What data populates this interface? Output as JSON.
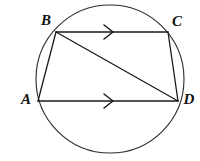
{
  "figure": {
    "background_color": "#ffffff",
    "stroke_color": "#1a1a1a",
    "circle_stroke_color": "#2b2b2b",
    "label_color": "#111111",
    "width": 200,
    "height": 161
  },
  "circle": {
    "name": "circumscribed-circle",
    "cx": 110,
    "cy": 79,
    "r": 74
  },
  "vertices": [
    {
      "id": "A",
      "label": "A",
      "x": 38,
      "y": 101,
      "label_x": 26,
      "label_y": 101
    },
    {
      "id": "B",
      "label": "B",
      "x": 56,
      "y": 32,
      "label_x": 46,
      "label_y": 22
    },
    {
      "id": "C",
      "label": "C",
      "x": 168,
      "y": 32,
      "label_x": 177,
      "label_y": 23
    },
    {
      "id": "D",
      "label": "D",
      "x": 178,
      "y": 101,
      "label_x": 189,
      "label_y": 101
    }
  ],
  "segments": [
    {
      "id": "AB",
      "from": "A",
      "to": "B",
      "kind": "chord",
      "x1": 38,
      "y1": 101,
      "x2": 56,
      "y2": 32
    },
    {
      "id": "BC",
      "from": "B",
      "to": "C",
      "kind": "chord",
      "x1": 56,
      "y1": 32,
      "x2": 168,
      "y2": 32
    },
    {
      "id": "CD",
      "from": "C",
      "to": "D",
      "kind": "chord",
      "x1": 168,
      "y1": 32,
      "x2": 178,
      "y2": 101
    },
    {
      "id": "AD",
      "from": "A",
      "to": "D",
      "kind": "chord",
      "x1": 38,
      "y1": 101,
      "x2": 178,
      "y2": 101
    },
    {
      "id": "BD",
      "from": "B",
      "to": "D",
      "kind": "diagonal",
      "x1": 56,
      "y1": 32,
      "x2": 178,
      "y2": 101
    }
  ],
  "parallel_marks": [
    {
      "id": "mark-BC",
      "on_segment": "BC",
      "glyph": "single-chevron-right",
      "x": 110,
      "y": 32,
      "size": 7
    },
    {
      "id": "mark-AD",
      "on_segment": "AD",
      "glyph": "single-chevron-right",
      "x": 110,
      "y": 101,
      "size": 7
    }
  ],
  "relations": {
    "parallel_pair": "BC || AD",
    "marked_with": "single arrowhead"
  }
}
